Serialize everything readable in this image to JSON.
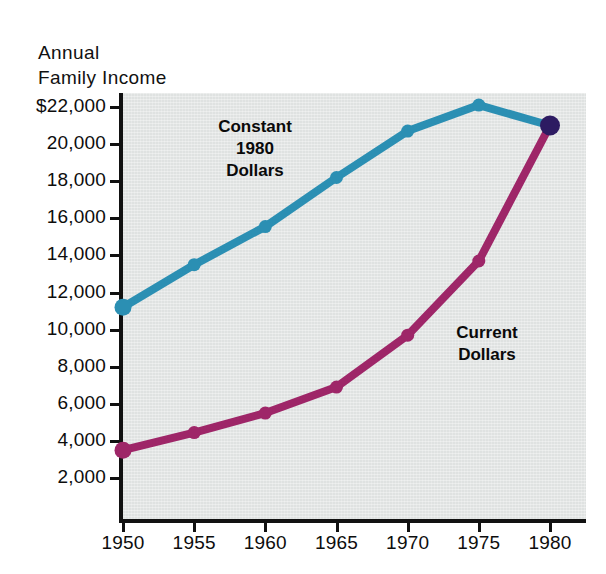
{
  "chart_data": {
    "type": "line",
    "title": "Annual Family Income",
    "title_lines": [
      "Annual",
      "Family Income"
    ],
    "xlabel": "",
    "ylabel": "Annual Family Income",
    "x": [
      1950,
      1955,
      1960,
      1965,
      1970,
      1975,
      1980
    ],
    "categories": [
      "1950",
      "1955",
      "1960",
      "1965",
      "1970",
      "1975",
      "1980"
    ],
    "xtick_labels": [
      "1950",
      "1955",
      "1960",
      "1965",
      "1970",
      "1975",
      "1980"
    ],
    "ytick_labels": [
      "$22,000",
      "20,000",
      "18,000",
      "16,000",
      "14,000",
      "12,000",
      "10,000",
      "8,000",
      "6,000",
      "4,000",
      "2,000"
    ],
    "ytick_values": [
      22000,
      20000,
      18000,
      16000,
      14000,
      12000,
      10000,
      8000,
      6000,
      4000,
      2000
    ],
    "ylim": [
      1200,
      23000
    ],
    "xlim": [
      1949,
      1982
    ],
    "grid": false,
    "legend": "inline-annotations",
    "series": [
      {
        "name": "Constant 1980 Dollars",
        "label_lines": [
          "Constant",
          "1980",
          "Dollars"
        ],
        "color": "#2b8fb3",
        "values": [
          11200,
          13500,
          15550,
          18200,
          20700,
          22100,
          21000
        ]
      },
      {
        "name": "Current Dollars",
        "label_lines": [
          "Current",
          "Dollars"
        ],
        "color": "#9e2668",
        "values": [
          3500,
          4450,
          5500,
          6900,
          9700,
          13700,
          21000
        ]
      }
    ],
    "endpoint_marker": {
      "name": "1980-convergence-point",
      "color": "#2d1b62",
      "x": 1980,
      "y": 21000
    },
    "plot_background": "#dfe2e1",
    "axis_color": "#111111"
  }
}
